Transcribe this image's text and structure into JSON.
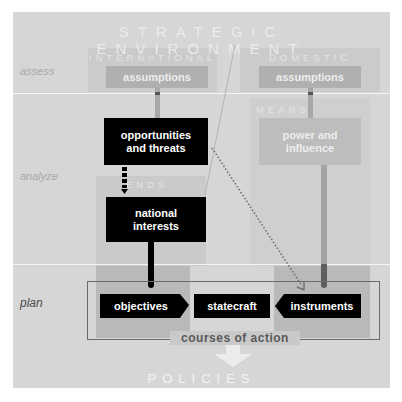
{
  "diagram": {
    "title": "STRATEGIC ENVIRONMENT",
    "row_labels": {
      "assess": "assess",
      "analyze": "analyze",
      "plan": "plan"
    },
    "regions": {
      "international": "INTERNATIONAL",
      "domestic": "DOMESTIC",
      "means": "MEANS",
      "ends": "ENDS"
    },
    "boxes": {
      "intl_assumptions": "assumptions",
      "dom_assumptions": "assumptions",
      "opportunities_line1": "opportunities",
      "opportunities_line2": "and threats",
      "power_line1": "power and",
      "power_line2": "influence",
      "national_line1": "national",
      "national_line2": "interests",
      "objectives": "objectives",
      "statecraft": "statecraft",
      "instruments": "instruments"
    },
    "courses_of_action": "courses of action",
    "output": "POLICIES",
    "colors": {
      "panel": "#d6d6d6",
      "plan_band": "#c9c9c9",
      "region_shade": "#c4c4c4",
      "gray_box": "#b5b5b5",
      "black_box": "#000000",
      "arrow_light": "#ececec"
    }
  }
}
